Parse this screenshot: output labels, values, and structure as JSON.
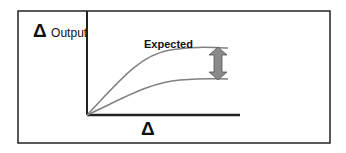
{
  "diagram": {
    "y_axis": {
      "symbol": "Δ",
      "label": "Output"
    },
    "x_axis": {
      "symbol": "Δ"
    },
    "curves": [
      {
        "name": "expected-curve",
        "label": "Expected"
      },
      {
        "name": "actual-curve"
      }
    ],
    "gap_indicator": "double-headed-arrow",
    "colors": {
      "frame": "#222222",
      "curve": "#808080",
      "arrow_fill": "#8a8a8a",
      "arrow_stroke": "#555555"
    }
  }
}
